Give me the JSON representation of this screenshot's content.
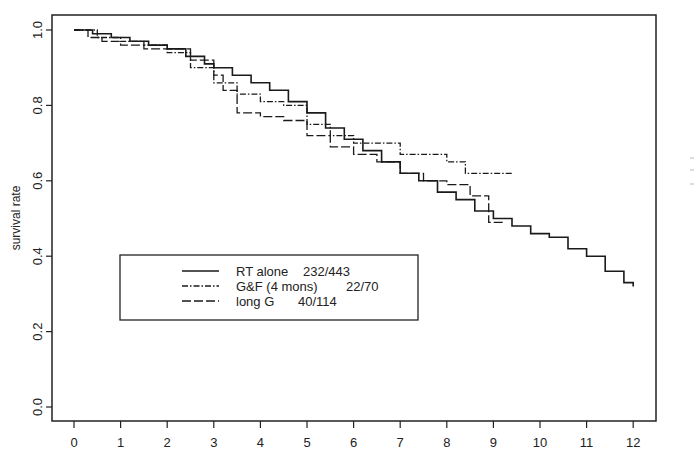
{
  "chart_data": {
    "type": "line",
    "subtype": "kaplan-meier step",
    "title": "",
    "xlabel": "",
    "ylabel": "survival rate",
    "xlim": [
      -0.3,
      12.5
    ],
    "ylim": [
      -0.04,
      1.04
    ],
    "x_ticks": [
      0,
      1,
      2,
      3,
      4,
      5,
      6,
      7,
      8,
      9,
      10,
      11,
      12
    ],
    "x_tick_labels": [
      "0",
      "1",
      "2",
      "3",
      "4",
      "5",
      "6",
      "7",
      "8",
      "9",
      "10",
      "11",
      "12"
    ],
    "y_ticks": [
      0.0,
      0.2,
      0.4,
      0.6,
      0.8,
      1.0
    ],
    "y_tick_labels": [
      "0.0",
      "0.2",
      "0.4",
      "0.6",
      "0.8",
      "1.0"
    ],
    "grid": false,
    "legend_position": "lower-left inside",
    "series": [
      {
        "name": "RT alone  232/443",
        "label": "RT alone",
        "events": "232/443",
        "line_style": "solid",
        "x": [
          0.0,
          0.4,
          0.8,
          1.2,
          1.6,
          2.0,
          2.4,
          2.8,
          3.0,
          3.4,
          3.8,
          4.2,
          4.6,
          5.0,
          5.4,
          5.8,
          6.2,
          6.6,
          7.0,
          7.4,
          7.8,
          8.2,
          8.6,
          9.0,
          9.4,
          9.8,
          10.2,
          10.6,
          11.0,
          11.4,
          11.8,
          12.0
        ],
        "y": [
          1.0,
          0.99,
          0.98,
          0.97,
          0.96,
          0.95,
          0.93,
          0.91,
          0.9,
          0.88,
          0.86,
          0.84,
          0.81,
          0.78,
          0.74,
          0.71,
          0.68,
          0.65,
          0.62,
          0.6,
          0.57,
          0.55,
          0.52,
          0.5,
          0.48,
          0.46,
          0.45,
          0.42,
          0.4,
          0.36,
          0.33,
          0.32
        ]
      },
      {
        "name": "G&F (4 mons)  22/70",
        "label": "G&F (4 mons)",
        "events": "22/70",
        "line_style": "dot-dash",
        "x": [
          0.0,
          0.5,
          1.0,
          1.5,
          2.0,
          2.5,
          3.0,
          3.5,
          4.0,
          4.5,
          5.0,
          5.5,
          6.0,
          6.5,
          7.0,
          7.5,
          8.0,
          8.4,
          8.8,
          9.4
        ],
        "y": [
          1.0,
          0.98,
          0.97,
          0.96,
          0.94,
          0.9,
          0.86,
          0.83,
          0.81,
          0.8,
          0.75,
          0.72,
          0.7,
          0.7,
          0.67,
          0.67,
          0.65,
          0.62,
          0.62,
          0.62
        ]
      },
      {
        "name": "long G    40/114",
        "label": "long G",
        "events": "40/114",
        "line_style": "dashed",
        "x": [
          0.0,
          0.3,
          0.6,
          1.0,
          1.5,
          2.0,
          2.5,
          3.0,
          3.2,
          3.5,
          4.0,
          4.5,
          5.0,
          5.5,
          6.0,
          6.5,
          7.0,
          7.5,
          8.0,
          8.5,
          8.9,
          9.2
        ],
        "y": [
          1.0,
          0.98,
          0.97,
          0.96,
          0.95,
          0.95,
          0.92,
          0.88,
          0.84,
          0.78,
          0.77,
          0.76,
          0.72,
          0.69,
          0.67,
          0.65,
          0.62,
          0.6,
          0.59,
          0.56,
          0.49,
          0.49
        ]
      }
    ]
  },
  "legend": {
    "items": [
      {
        "label": "RT alone",
        "value": "232/443",
        "style": "solid"
      },
      {
        "label": "G&F (4 mons)",
        "value": "22/70",
        "style": "dot-dash"
      },
      {
        "label": "long G",
        "value": "40/114",
        "style": "dashed"
      }
    ]
  },
  "colors": {
    "line": "#1a1a1a",
    "frame": "#222222",
    "background": "#ffffff"
  }
}
